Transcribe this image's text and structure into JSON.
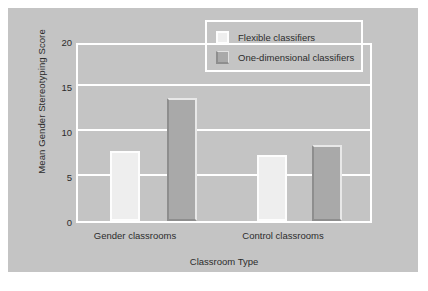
{
  "chart_data": {
    "type": "bar",
    "title": "",
    "xlabel": "Classroom Type",
    "ylabel": "Mean Gender Stereotyping Score",
    "categories": [
      "Gender classrooms",
      "Control classrooms"
    ],
    "series": [
      {
        "name": "Flexible classifiers",
        "values": [
          8,
          7.5
        ],
        "color": "#eeeeee"
      },
      {
        "name": "One-dimensional classifiers",
        "values": [
          14,
          8.6
        ],
        "color": "#a9a9a9"
      }
    ],
    "ylim": [
      0,
      20
    ],
    "yticks": [
      0,
      5,
      10,
      15,
      20
    ],
    "ytick_labels": [
      "0",
      "5",
      "10",
      "15",
      "20"
    ],
    "grid": true,
    "legend_position": "top-right",
    "background_color": "#c4c4c4",
    "gridline_color": "#ffffff",
    "text_color": "#2c2c2c"
  },
  "legend": {
    "entries": [
      {
        "label": "Flexible classifiers",
        "swatch": "light-square-swatch"
      },
      {
        "label": "One-dimensional classifiers",
        "swatch": "dark-square-swatch"
      }
    ]
  },
  "axes": {
    "y_title": "Mean Gender Stereotyping Score",
    "x_title": "Classroom Type",
    "y_tick_0": "0",
    "y_tick_1": "5",
    "y_tick_2": "10",
    "y_tick_3": "15",
    "y_tick_4": "20",
    "x_tick_0": "Gender classrooms",
    "x_tick_1": "Control classrooms"
  }
}
